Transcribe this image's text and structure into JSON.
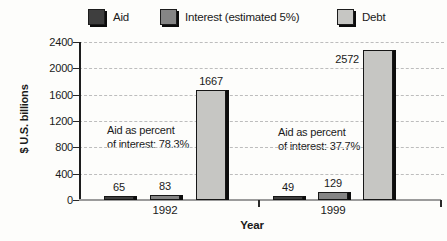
{
  "chart_data": {
    "type": "bar",
    "title": "",
    "xlabel": "Year",
    "ylabel": "$ U.S. billions",
    "categories": [
      "1992",
      "1999"
    ],
    "series": [
      {
        "name": "Aid",
        "color": "#3e3e3e",
        "values": [
          65,
          49
        ]
      },
      {
        "name": "Interest (estimated 5%)",
        "color": "#858585",
        "values": [
          83,
          129
        ]
      },
      {
        "name": "Debt",
        "color": "#c6c6c3",
        "values": [
          1667,
          2572
        ]
      }
    ],
    "yticks": [
      0,
      400,
      800,
      1200,
      1600,
      2000,
      2400
    ],
    "ylim": [
      0,
      2400
    ],
    "grid": "horizontal-dashed",
    "legend_position": "top",
    "value_labels": true,
    "annotations": [
      {
        "lines": [
          "Aid as percent",
          "of interest: 78.3%"
        ]
      },
      {
        "lines": [
          "Aid as percent",
          "of interest: 37.7%"
        ]
      }
    ]
  }
}
